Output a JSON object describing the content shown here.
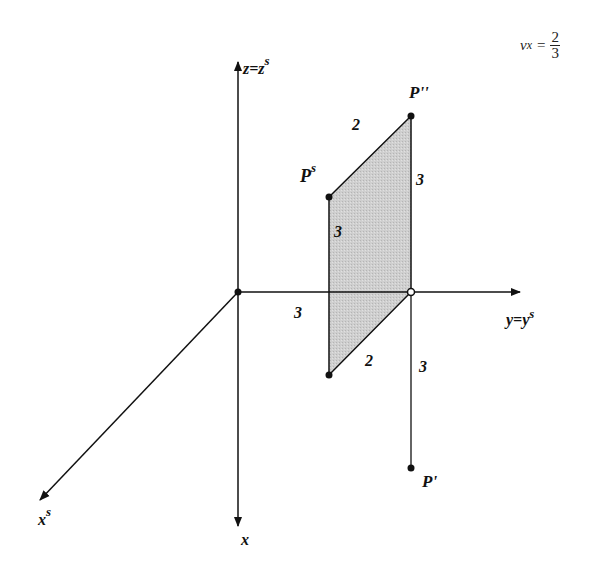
{
  "formula": {
    "variable": "v",
    "subscript": "x",
    "equals": "=",
    "numerator": "2",
    "denominator": "3"
  },
  "axes": {
    "z_label": "z=z",
    "z_label_sup": "s",
    "y_label": "y=y",
    "y_label_sup": "s",
    "x_label": "x",
    "xs_label": "x",
    "xs_label_sup": "s"
  },
  "points": {
    "p_double_prime": "P''",
    "p_s": "P",
    "p_s_sup": "s",
    "p_prime": "P'"
  },
  "dimensions": {
    "top_edge": "2",
    "right_edge_upper": "3",
    "left_edge": "3",
    "origin_to_y": "3",
    "bottom_edge": "2",
    "right_edge_lower": "3"
  },
  "colors": {
    "line": "#111111",
    "fill": "#c8c8c8",
    "background": "#ffffff"
  }
}
